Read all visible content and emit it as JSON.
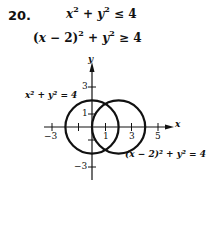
{
  "problem": {
    "number": "20.",
    "inequality_1": {
      "lhs": "x² + y²",
      "op": "≤",
      "rhs": "4"
    },
    "inequality_2": {
      "lhs": "(x − 2)² + y²",
      "op": "≥",
      "rhs": "4"
    }
  },
  "graph": {
    "x_axis_label": "x",
    "y_axis_label": "y",
    "x_ticks": [
      "−3",
      "1",
      "3",
      "5"
    ],
    "y_ticks": [
      "3",
      "1",
      "−3"
    ],
    "circle_1_label": "x² + y² = 4",
    "circle_2_label": "(x − 2)² + y² = 4",
    "circle_1": {
      "cx": 0,
      "cy": 0,
      "r": 2
    },
    "circle_2": {
      "cx": 2,
      "cy": 0,
      "r": 2
    }
  }
}
